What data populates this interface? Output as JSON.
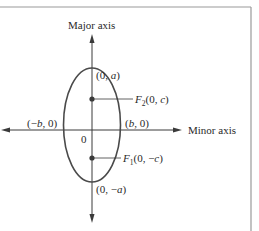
{
  "diagram": {
    "type": "ellipse-vertical-major-axis",
    "axes": {
      "vertical_label": "Major axis",
      "horizontal_label": "Minor axis"
    },
    "origin_label": "0",
    "vertices": {
      "top": {
        "pre": "(0, ",
        "var": "a",
        "post": ")"
      },
      "bottom": {
        "pre": "(0, −",
        "var": "a",
        "post": ")"
      }
    },
    "covertices": {
      "left": {
        "pre": "(−",
        "var": "b",
        "post": ", 0)"
      },
      "right": {
        "pre": "(",
        "var": "b",
        "post": ", 0)"
      }
    },
    "foci": {
      "upper": {
        "name": "F",
        "sub": "2",
        "pre": "(0, ",
        "var": "c",
        "post": ")"
      },
      "lower": {
        "name": "F",
        "sub": "1",
        "pre": "(0, −",
        "var": "c",
        "post": ")"
      }
    },
    "colors": {
      "line": "#3a3a3a",
      "ellipse": "#4a4a4a",
      "frame": "#9a9a9a",
      "text": "#2a2a2a"
    }
  }
}
